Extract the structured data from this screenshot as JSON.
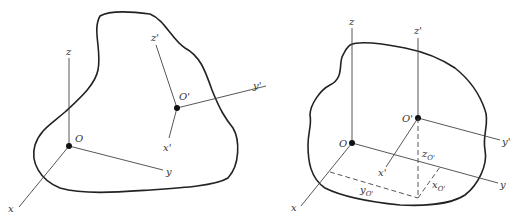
{
  "left_figure": {
    "origin_label": "O",
    "axes": {
      "x": "x",
      "y": "y",
      "z": "z"
    },
    "prime_origin_label": "O'",
    "prime_axes": {
      "x": "x'",
      "y": "y'",
      "z": "z'"
    }
  },
  "right_figure": {
    "origin_label": "O",
    "axes": {
      "x": "x",
      "y": "y",
      "z": "z"
    },
    "prime_origin_label": "O'",
    "prime_axes": {
      "x": "x'",
      "y": "y'",
      "z": "z'"
    },
    "offsets": {
      "x": "x",
      "y": "y",
      "z": "z",
      "sub": "O'"
    }
  }
}
